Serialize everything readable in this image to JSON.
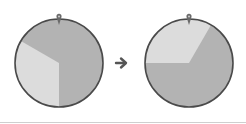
{
  "diagram": {
    "type": "before-after-spinner",
    "colors": {
      "dark_slice": "#b3b3b3",
      "light_slice": "#dcdcdc",
      "outline": "#4a4a4a",
      "pointer": "#6a6a6a",
      "arrow": "#555555",
      "divider": "#cfcfcf"
    },
    "before": {
      "label": "",
      "slices": [
        {
          "name": "dark",
          "start_deg": -60,
          "end_deg": 180,
          "fraction": 0.667
        },
        {
          "name": "light",
          "start_deg": 180,
          "end_deg": 300,
          "fraction": 0.333
        }
      ]
    },
    "after": {
      "label": "",
      "slices": [
        {
          "name": "light",
          "start_deg": -90,
          "end_deg": 30,
          "fraction": 0.333
        },
        {
          "name": "dark",
          "start_deg": 30,
          "end_deg": 270,
          "fraction": 0.667
        }
      ]
    },
    "transition_arrow": "right-arrow"
  }
}
